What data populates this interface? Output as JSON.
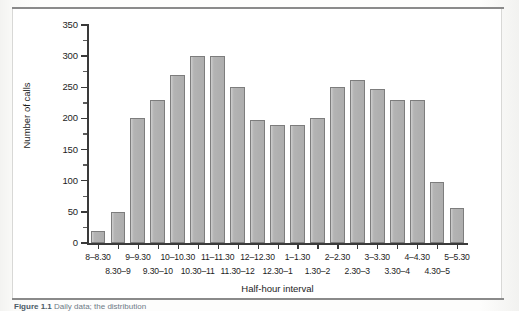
{
  "figure": {
    "caption_prefix": "Figure 1.1",
    "caption_text": "Daily data; the distribution"
  },
  "chart_data": {
    "type": "bar",
    "title": "",
    "xlabel": "Half-hour interval",
    "ylabel": "Number of calls",
    "ylim": [
      0,
      350
    ],
    "ytick_values": [
      0,
      50,
      100,
      150,
      200,
      250,
      300,
      350
    ],
    "ytick_labels": [
      "0",
      "50",
      "100",
      "150",
      "200",
      "250",
      "300",
      "350"
    ],
    "ytick_minor_values": [
      25,
      75,
      125,
      175,
      225,
      275,
      325
    ],
    "grid": false,
    "legend": null,
    "categories": [
      "8–8.30",
      "8.30–9",
      "9–9.30",
      "9.30–10",
      "10–10.30",
      "10.30–11",
      "11–11.30",
      "11.30–12",
      "12–12.30",
      "12.30–1",
      "1–1.30",
      "1.30–2",
      "2–2.30",
      "2.30–3",
      "3–3.30",
      "3.30–4",
      "4–4.30",
      "4.30–5",
      "5–5.30"
    ],
    "values": [
      20,
      50,
      200,
      230,
      270,
      300,
      300,
      250,
      198,
      190,
      189,
      200,
      250,
      261,
      248,
      230,
      230,
      98,
      57
    ]
  }
}
